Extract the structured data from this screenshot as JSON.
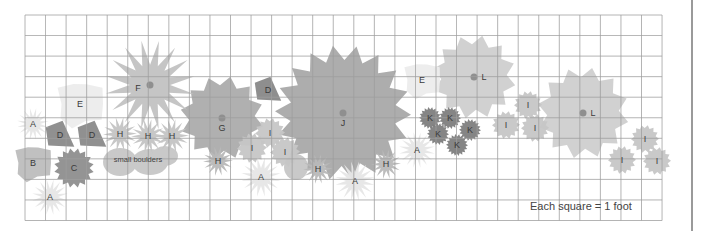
{
  "diagram": {
    "type": "garden-planting-plan",
    "scale_note": "Each square = 1 foot",
    "grid": {
      "left": 25,
      "top": 15,
      "cell": 20.55,
      "cols": 31,
      "rows": 10,
      "line_color": "#9e9e9e"
    },
    "annotations": [
      {
        "text": "small boulders",
        "x": 138,
        "y": 162
      }
    ],
    "plants": [
      {
        "label": "J",
        "x": 343,
        "y": 113,
        "r": 68,
        "color": "#a9a9a9",
        "shape": "burst",
        "spikes": 18,
        "center_dot": true
      },
      {
        "label": "G",
        "x": 222,
        "y": 118,
        "r": 42,
        "color": "#acacac",
        "shape": "burst",
        "spikes": 12,
        "center_dot": true
      },
      {
        "label": "F",
        "x": 150,
        "y": 85,
        "r": 45,
        "color": "#c2c2c2",
        "shape": "star",
        "spikes": 16,
        "center_dot": true
      },
      {
        "label": "L",
        "x": 474,
        "y": 77,
        "r": 42,
        "color": "#cfcfcf",
        "shape": "burst",
        "spikes": 12,
        "center_dot": true
      },
      {
        "label": "L",
        "x": 583,
        "y": 113,
        "r": 46,
        "color": "#cfcfcf",
        "shape": "burst",
        "spikes": 12,
        "center_dot": true
      },
      {
        "label": "E",
        "x": 80,
        "y": 104,
        "r": 28,
        "color": "#ececec",
        "shape": "blob"
      },
      {
        "label": "E",
        "x": 422,
        "y": 80,
        "r": 22,
        "color": "#ececec",
        "shape": "blob"
      },
      {
        "label": "D",
        "x": 268,
        "y": 90,
        "r": 12,
        "color": "#888888",
        "shape": "tri"
      },
      {
        "label": "D",
        "x": 60,
        "y": 135,
        "r": 13,
        "color": "#8a8a8a",
        "shape": "tri"
      },
      {
        "label": "D",
        "x": 92,
        "y": 135,
        "r": 13,
        "color": "#8a8a8a",
        "shape": "tri"
      },
      {
        "label": "C",
        "x": 74,
        "y": 168,
        "r": 20,
        "color": "#8e8e8e",
        "shape": "burst",
        "spikes": 16
      },
      {
        "label": "B",
        "x": 33,
        "y": 163,
        "r": 22,
        "color": "#bdbdbd",
        "shape": "blob"
      },
      {
        "label": "A",
        "x": 33,
        "y": 124,
        "r": 16,
        "color": "#e6e6e6",
        "shape": "star",
        "spikes": 16
      },
      {
        "label": "A",
        "x": 50,
        "y": 197,
        "r": 18,
        "color": "#e6e6e6",
        "shape": "star",
        "spikes": 16
      },
      {
        "label": "A",
        "x": 261,
        "y": 177,
        "r": 20,
        "color": "#e6e6e6",
        "shape": "star",
        "spikes": 16
      },
      {
        "label": "A",
        "x": 355,
        "y": 181,
        "r": 20,
        "color": "#e6e6e6",
        "shape": "star",
        "spikes": 16
      },
      {
        "label": "A",
        "x": 417,
        "y": 150,
        "r": 18,
        "color": "#e6e6e6",
        "shape": "star",
        "spikes": 16
      },
      {
        "label": "H",
        "x": 120,
        "y": 134,
        "r": 17,
        "color": "#c4c4c4",
        "shape": "star",
        "spikes": 14
      },
      {
        "label": "H",
        "x": 148,
        "y": 136,
        "r": 17,
        "color": "#c4c4c4",
        "shape": "star",
        "spikes": 14
      },
      {
        "label": "H",
        "x": 172,
        "y": 136,
        "r": 17,
        "color": "#c4c4c4",
        "shape": "star",
        "spikes": 14
      },
      {
        "label": "H",
        "x": 218,
        "y": 161,
        "r": 15,
        "color": "#b8b8b8",
        "shape": "star",
        "spikes": 14
      },
      {
        "label": "H",
        "x": 318,
        "y": 169,
        "r": 15,
        "color": "#b8b8b8",
        "shape": "star",
        "spikes": 14
      },
      {
        "label": "H",
        "x": 386,
        "y": 164,
        "r": 15,
        "color": "#b8b8b8",
        "shape": "star",
        "spikes": 14
      },
      {
        "label": "I",
        "x": 270,
        "y": 133,
        "r": 15,
        "color": "#c6c6c6",
        "shape": "burst",
        "spikes": 14
      },
      {
        "label": "I",
        "x": 252,
        "y": 148,
        "r": 15,
        "color": "#c6c6c6",
        "shape": "burst",
        "spikes": 14
      },
      {
        "label": "I",
        "x": 285,
        "y": 152,
        "r": 15,
        "color": "#c6c6c6",
        "shape": "burst",
        "spikes": 14
      },
      {
        "label": "I",
        "x": 528,
        "y": 105,
        "r": 14,
        "color": "#c6c6c6",
        "shape": "burst",
        "spikes": 14
      },
      {
        "label": "I",
        "x": 506,
        "y": 125,
        "r": 14,
        "color": "#c6c6c6",
        "shape": "burst",
        "spikes": 14
      },
      {
        "label": "I",
        "x": 535,
        "y": 128,
        "r": 14,
        "color": "#c6c6c6",
        "shape": "burst",
        "spikes": 14
      },
      {
        "label": "I",
        "x": 645,
        "y": 139,
        "r": 14,
        "color": "#c6c6c6",
        "shape": "burst",
        "spikes": 14
      },
      {
        "label": "I",
        "x": 622,
        "y": 160,
        "r": 14,
        "color": "#c6c6c6",
        "shape": "burst",
        "spikes": 14
      },
      {
        "label": "I",
        "x": 657,
        "y": 161,
        "r": 14,
        "color": "#c6c6c6",
        "shape": "burst",
        "spikes": 14
      },
      {
        "label": "K",
        "x": 430,
        "y": 118,
        "r": 11,
        "color": "#7e7e7e",
        "shape": "burst",
        "spikes": 18
      },
      {
        "label": "K",
        "x": 450,
        "y": 118,
        "r": 11,
        "color": "#7e7e7e",
        "shape": "burst",
        "spikes": 18
      },
      {
        "label": "K",
        "x": 438,
        "y": 134,
        "r": 11,
        "color": "#7e7e7e",
        "shape": "burst",
        "spikes": 18
      },
      {
        "label": "K",
        "x": 470,
        "y": 130,
        "r": 11,
        "color": "#7e7e7e",
        "shape": "burst",
        "spikes": 18
      },
      {
        "label": "K",
        "x": 457,
        "y": 145,
        "r": 11,
        "color": "#7e7e7e",
        "shape": "burst",
        "spikes": 18
      }
    ],
    "boulders": [
      {
        "x": 120,
        "y": 162,
        "rx": 17,
        "ry": 14
      },
      {
        "x": 150,
        "y": 162,
        "rx": 18,
        "ry": 13
      },
      {
        "x": 165,
        "y": 156,
        "rx": 13,
        "ry": 10
      },
      {
        "x": 296,
        "y": 167,
        "rx": 12,
        "ry": 13
      }
    ]
  }
}
